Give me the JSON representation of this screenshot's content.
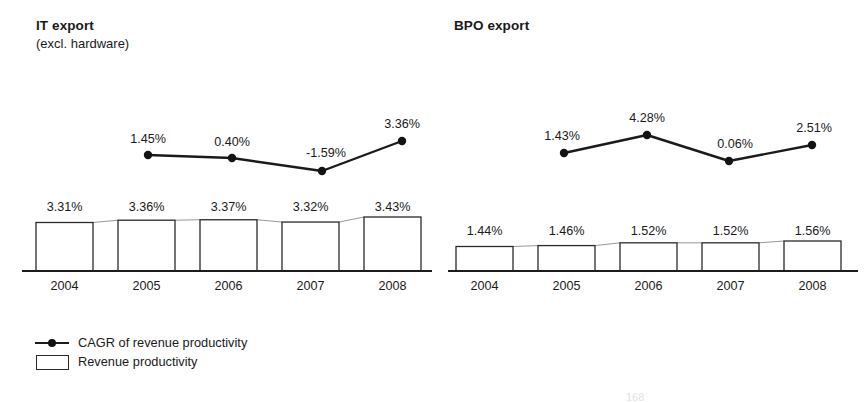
{
  "figure": {
    "years": [
      "2004",
      "2005",
      "2006",
      "2007",
      "2008"
    ],
    "artifact_text": "168"
  },
  "legend": {
    "items": [
      {
        "key": "line-marker",
        "label": "CAGR of revenue productivity"
      },
      {
        "key": "open-rectangle",
        "label": "Revenue productivity"
      }
    ]
  },
  "panels": [
    {
      "id": "it",
      "title": "IT export",
      "subtitle": "(excl. hardware)"
    },
    {
      "id": "bpo",
      "title": "BPO export",
      "subtitle": ""
    }
  ],
  "chart_data": [
    {
      "type": "bar",
      "title": "IT export (excl. hardware)",
      "xlabel": "",
      "ylabel": "",
      "grid": false,
      "legend_position": "bottom-left",
      "categories": [
        "2004",
        "2005",
        "2006",
        "2007",
        "2008"
      ],
      "series": [
        {
          "name": "Revenue productivity",
          "render": "bar",
          "values": [
            3.31,
            3.36,
            3.37,
            3.32,
            3.43
          ],
          "labels": [
            "3.31%",
            "3.36%",
            "3.37%",
            "3.32%",
            "3.43%"
          ]
        },
        {
          "name": "CAGR of revenue productivity",
          "render": "line",
          "categories": [
            "2005",
            "2006",
            "2007",
            "2008"
          ],
          "values": [
            1.45,
            0.4,
            -1.59,
            3.36
          ],
          "labels": [
            "1.45%",
            "0.40%",
            "-1.59%",
            "3.36%"
          ]
        }
      ]
    },
    {
      "type": "bar",
      "title": "BPO export",
      "xlabel": "",
      "ylabel": "",
      "grid": false,
      "legend_position": "bottom-left",
      "categories": [
        "2004",
        "2005",
        "2006",
        "2007",
        "2008"
      ],
      "series": [
        {
          "name": "Revenue productivity",
          "render": "bar",
          "values": [
            1.44,
            1.46,
            1.52,
            1.52,
            1.56
          ],
          "labels": [
            "1.44%",
            "1.46%",
            "1.52%",
            "1.52%",
            "1.56%"
          ]
        },
        {
          "name": "CAGR of revenue productivity",
          "render": "line",
          "categories": [
            "2005",
            "2006",
            "2007",
            "2008"
          ],
          "values": [
            1.43,
            4.28,
            0.06,
            2.51
          ],
          "labels": [
            "1.43%",
            "4.28%",
            "0.06%",
            "2.51%"
          ]
        }
      ]
    }
  ]
}
